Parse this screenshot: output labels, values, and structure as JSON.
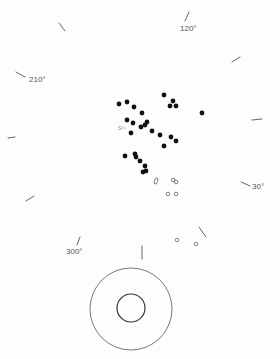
{
  "diagram": {
    "width": 280,
    "height": 359,
    "colors": {
      "background": "#fdfdfd",
      "tick": "#555555",
      "label": "#555555",
      "filled_dot": "#111111",
      "open_mark": "#666666",
      "ring": "#555555",
      "inner_ring": "#333333"
    },
    "angle_labels": [
      {
        "text": "120°",
        "x": 180,
        "y": 31
      },
      {
        "text": "210°",
        "x": 29,
        "y": 82
      },
      {
        "text": "30°",
        "x": 252,
        "y": 189
      },
      {
        "text": "300°",
        "x": 66,
        "y": 254
      }
    ],
    "ticks": [
      {
        "name": "tick-120",
        "x1": 185,
        "y1": 21,
        "x2": 189,
        "y2": 12
      },
      {
        "name": "tick-upper-left",
        "x1": 59,
        "y1": 23,
        "x2": 65,
        "y2": 31
      },
      {
        "name": "tick-upper-right",
        "x1": 232,
        "y1": 62,
        "x2": 240,
        "y2": 57
      },
      {
        "name": "tick-210",
        "x1": 16,
        "y1": 72,
        "x2": 25,
        "y2": 77
      },
      {
        "name": "tick-right",
        "x1": 252,
        "y1": 120,
        "x2": 262,
        "y2": 119
      },
      {
        "name": "tick-left",
        "x1": 8,
        "y1": 138,
        "x2": 15,
        "y2": 137
      },
      {
        "name": "tick-30",
        "x1": 241,
        "y1": 182,
        "x2": 250,
        "y2": 186
      },
      {
        "name": "tick-lower-left",
        "x1": 26,
        "y1": 201,
        "x2": 34,
        "y2": 196
      },
      {
        "name": "tick-lower-right",
        "x1": 199,
        "y1": 227,
        "x2": 206,
        "y2": 237
      },
      {
        "name": "tick-300",
        "x1": 77,
        "y1": 245,
        "x2": 80,
        "y2": 237
      },
      {
        "name": "tick-bottom",
        "x1": 142,
        "y1": 246,
        "x2": 142,
        "y2": 259
      }
    ],
    "filled_dots": [
      {
        "x": 119,
        "y": 104
      },
      {
        "x": 127,
        "y": 102
      },
      {
        "x": 134,
        "y": 107
      },
      {
        "x": 142,
        "y": 113
      },
      {
        "x": 164,
        "y": 95
      },
      {
        "x": 173,
        "y": 101
      },
      {
        "x": 170,
        "y": 106
      },
      {
        "x": 176,
        "y": 106
      },
      {
        "x": 202,
        "y": 113
      },
      {
        "x": 127,
        "y": 120
      },
      {
        "x": 133,
        "y": 123
      },
      {
        "x": 147,
        "y": 122
      },
      {
        "x": 145,
        "y": 125
      },
      {
        "x": 141,
        "y": 127
      },
      {
        "x": 152,
        "y": 131
      },
      {
        "x": 131,
        "y": 133
      },
      {
        "x": 160,
        "y": 135
      },
      {
        "x": 171,
        "y": 137
      },
      {
        "x": 176,
        "y": 141
      },
      {
        "x": 164,
        "y": 146
      },
      {
        "x": 125,
        "y": 156
      },
      {
        "x": 135,
        "y": 154
      },
      {
        "x": 136,
        "y": 157
      },
      {
        "x": 140,
        "y": 161
      },
      {
        "x": 145,
        "y": 166
      },
      {
        "x": 143,
        "y": 172
      },
      {
        "x": 146,
        "y": 171
      }
    ],
    "open_circles": [
      {
        "x": 173,
        "y": 180,
        "r": 1.8
      },
      {
        "x": 176,
        "y": 182,
        "r": 1.8
      },
      {
        "x": 168,
        "y": 194,
        "r": 1.8
      },
      {
        "x": 176,
        "y": 194,
        "r": 1.8
      },
      {
        "x": 177,
        "y": 240,
        "r": 1.8
      },
      {
        "x": 196,
        "y": 244,
        "r": 1.8
      }
    ],
    "open_oval": {
      "cx": 156,
      "cy": 181,
      "rx": 1.6,
      "ry": 3.2,
      "rotate": 20
    },
    "marker": {
      "label": "S",
      "x": 118,
      "y": 130,
      "arrow_x1": 121,
      "arrow_x2": 126,
      "arrow_y": 128
    },
    "rings": {
      "outer": {
        "cx": 131,
        "cy": 309,
        "r": 41
      },
      "inner": {
        "cx": 131,
        "cy": 308,
        "r": 14
      }
    }
  }
}
